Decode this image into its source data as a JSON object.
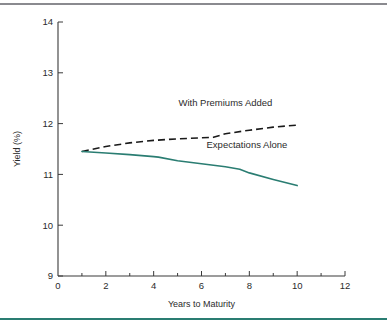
{
  "figure": {
    "top_rule_color": "#8a8a8f",
    "bottom_rule_color": "#2a7d72",
    "background": "#ffffff"
  },
  "chart_data": {
    "type": "line",
    "title": "",
    "xlabel": "Years to Maturity",
    "ylabel": "Yield (%)",
    "xlim": [
      0,
      12
    ],
    "ylim": [
      9,
      14
    ],
    "xticks": [
      0,
      2,
      4,
      6,
      8,
      10,
      12
    ],
    "xtick_labels": [
      "0",
      "2",
      "4",
      "6",
      "8",
      "10",
      "12"
    ],
    "xminor_ticks": [
      1,
      3,
      5,
      7,
      9,
      11
    ],
    "yticks": [
      9,
      10,
      11,
      12,
      13,
      14
    ],
    "ytick_labels": [
      "9",
      "10",
      "11",
      "12",
      "13",
      "14"
    ],
    "grid": false,
    "legend_position": "inline-annotations",
    "series": [
      {
        "name": "With Premiums Added",
        "style": "dashed",
        "color": "#1a1a1a",
        "label_x": 7.0,
        "label_y": 12.35,
        "x": [
          1.0,
          2.0,
          3.0,
          4.0,
          5.0,
          6.0,
          6.5,
          7.0,
          8.0,
          9.0,
          10.0
        ],
        "y": [
          11.45,
          11.55,
          11.62,
          11.67,
          11.7,
          11.72,
          11.73,
          11.8,
          11.87,
          11.93,
          11.97
        ]
      },
      {
        "name": "Expectations Alone",
        "style": "solid",
        "color": "#2a7d72",
        "label_x": 7.9,
        "label_y": 11.52,
        "x": [
          1.0,
          2.0,
          3.0,
          4.0,
          4.2,
          5.0,
          6.0,
          7.0,
          7.6,
          8.0,
          9.0,
          10.0
        ],
        "y": [
          11.45,
          11.42,
          11.39,
          11.35,
          11.34,
          11.27,
          11.21,
          11.15,
          11.1,
          11.03,
          10.9,
          10.78
        ]
      }
    ]
  }
}
